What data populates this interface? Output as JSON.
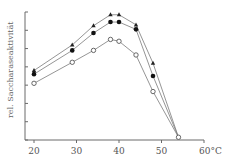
{
  "chart_data": {
    "type": "line",
    "title": "",
    "xlabel": "°C",
    "ylabel": "rel. Saccharaseaktivität",
    "xlim": [
      18,
      60
    ],
    "ylim": [
      0,
      7
    ],
    "x_ticks": [
      20,
      30,
      40,
      50,
      60
    ],
    "x_tick_labels": [
      "20",
      "30",
      "40",
      "50",
      "60°C"
    ],
    "y_ticks": [
      0,
      1,
      2,
      3,
      4,
      5,
      6,
      7
    ],
    "y_tick_labels": [
      "",
      "",
      "",
      "",
      "",
      "",
      "",
      ""
    ],
    "grid": false,
    "legend": null,
    "series": [
      {
        "name": "triangle",
        "marker": "filled-triangle",
        "x": [
          20,
          29,
          34,
          38,
          40,
          44,
          48,
          54
        ],
        "values": [
          3.8,
          5.2,
          6.25,
          6.85,
          6.85,
          6.3,
          4.2,
          0.15
        ]
      },
      {
        "name": "filled-circle",
        "marker": "filled-circle",
        "x": [
          20,
          29,
          34,
          38,
          40,
          44,
          48,
          54
        ],
        "values": [
          3.6,
          4.9,
          5.85,
          6.45,
          6.45,
          6.05,
          3.5,
          0.15
        ]
      },
      {
        "name": "open-circle",
        "marker": "open-circle",
        "x": [
          20,
          29,
          34,
          38,
          40,
          44,
          48,
          54
        ],
        "values": [
          3.1,
          4.25,
          4.9,
          5.5,
          5.4,
          4.65,
          2.65,
          0.15
        ]
      }
    ]
  }
}
